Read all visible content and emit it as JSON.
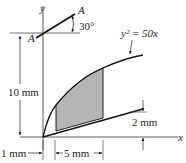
{
  "figure": {
    "axes": {
      "x_label": "x",
      "y_label": "y"
    },
    "curve_label": "y² = 50x",
    "section": {
      "label_top": "A",
      "label_left": "A",
      "angle": "30°"
    },
    "dimensions": {
      "height": "10 mm",
      "left_offset": "1 mm",
      "width": "5 mm",
      "right_gap": "2 mm"
    },
    "colors": {
      "line": "#111111",
      "shade": "#b5b5b5"
    }
  }
}
